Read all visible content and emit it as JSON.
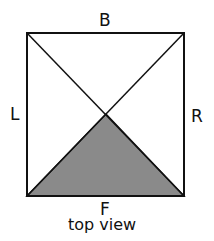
{
  "diagram": {
    "labels": {
      "top": "B",
      "left": "L",
      "right": "R",
      "bottom": "F"
    },
    "caption": "top view",
    "colors": {
      "stroke": "#111111",
      "shaded": "#8a8a8a",
      "background": "#ffffff"
    }
  }
}
